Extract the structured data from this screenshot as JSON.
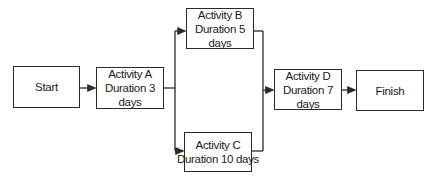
{
  "diagram": {
    "type": "activity-network",
    "nodes": [
      {
        "id": "start",
        "label": "Start",
        "duration": ""
      },
      {
        "id": "a",
        "label": "Activity A",
        "duration": "Duration 3 days"
      },
      {
        "id": "b",
        "label": "Activity B",
        "duration": "Duration 5 days"
      },
      {
        "id": "c",
        "label": "Activity C",
        "duration": "Duration 10 days"
      },
      {
        "id": "d",
        "label": "Activity D",
        "duration": "Duration 7 days"
      },
      {
        "id": "finish",
        "label": "Finish",
        "duration": ""
      }
    ],
    "edges": [
      {
        "from": "Start",
        "to": "Activity A"
      },
      {
        "from": "Activity A",
        "to": "Activity B"
      },
      {
        "from": "Activity A",
        "to": "Activity C"
      },
      {
        "from": "Activity B",
        "to": "Activity D"
      },
      {
        "from": "Activity C",
        "to": "Activity D"
      },
      {
        "from": "Activity D",
        "to": "Finish"
      }
    ],
    "colors": {
      "line": "#2a2a2a",
      "background": "#ffffff"
    }
  }
}
